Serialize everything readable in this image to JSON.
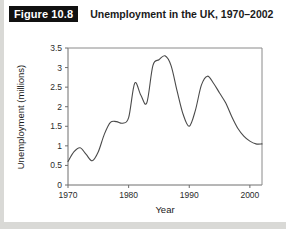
{
  "figure": {
    "number_label": "Figure 10.8",
    "title": "Unemployment in the UK, 1970–2002"
  },
  "colors": {
    "page_background": "#d9d9d6",
    "card_background": "#ffffff",
    "badge_background": "#111111",
    "badge_text": "#ffffff",
    "title_text": "#1a1a1a",
    "axis": "#6e6e6e",
    "frame": "#8a8a8a",
    "data_line": "#4a4a4a"
  },
  "chart_data": {
    "type": "line",
    "title": "Unemployment in the UK, 1970–2002",
    "xlabel": "Year",
    "ylabel": "Unemployment (millions)",
    "xlim": [
      1970,
      2002
    ],
    "ylim": [
      0,
      3.5
    ],
    "grid": false,
    "legend": false,
    "xticks": [
      1970,
      1980,
      1990,
      2000
    ],
    "xtick_labels": [
      "1970",
      "1980",
      "1990",
      "2000"
    ],
    "yticks": [
      0,
      0.5,
      1,
      1.5,
      2,
      2.5,
      3,
      3.5
    ],
    "ytick_labels": [
      "0",
      "0.5",
      "1",
      "1.5",
      "2",
      "2.5",
      "3",
      "3.5"
    ],
    "series": [
      {
        "name": "Unemployment (millions)",
        "x": [
          1970,
          1971,
          1972,
          1973,
          1974,
          1975,
          1976,
          1977,
          1978,
          1979,
          1980,
          1981,
          1982,
          1983,
          1984,
          1985,
          1986,
          1987,
          1988,
          1989,
          1990,
          1991,
          1992,
          1993,
          1994,
          1995,
          1996,
          1997,
          1998,
          1999,
          2000,
          2001,
          2002
        ],
        "values": [
          0.6,
          0.85,
          0.95,
          0.78,
          0.62,
          0.85,
          1.3,
          1.6,
          1.62,
          1.58,
          1.72,
          2.6,
          2.3,
          2.1,
          3.05,
          3.2,
          3.3,
          3.05,
          2.4,
          1.8,
          1.5,
          1.9,
          2.55,
          2.78,
          2.6,
          2.35,
          2.1,
          1.75,
          1.45,
          1.25,
          1.12,
          1.05,
          1.05
        ]
      }
    ]
  }
}
